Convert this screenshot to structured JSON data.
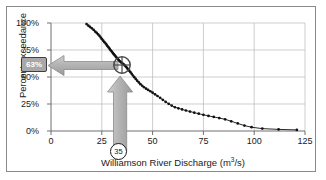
{
  "figure": {
    "name": "flow-duration-curve",
    "frame_color": "#8a8a8a",
    "background": "#ffffff"
  },
  "chart_data": {
    "type": "line",
    "title": "",
    "subtitle": "",
    "xlabel": "Williamson River Discharge (m3/s)",
    "xlabel_main": "Williamson River Discharge (m",
    "xlabel_sup": "3",
    "xlabel_tail": "/s)",
    "ylabel": "Percent exceedance",
    "xlim": [
      0,
      125
    ],
    "ylim": [
      0,
      100
    ],
    "grid": true,
    "legend": "none",
    "xticks": [
      0,
      25,
      50,
      75,
      100,
      125
    ],
    "xticklabels": [
      "0",
      "25",
      "50",
      "75",
      "100",
      "125"
    ],
    "yticks": [
      0,
      25,
      50,
      75,
      100
    ],
    "yticklabels": [
      "0%",
      "25%",
      "50%",
      "75%",
      "100%"
    ],
    "series": [
      {
        "name": "Flow duration curve",
        "marker": "dot",
        "color": "#111111",
        "x": [
          17.5,
          18.4,
          19.2,
          20.1,
          21.0,
          21.8,
          22.5,
          23.2,
          23.9,
          24.5,
          25.1,
          25.7,
          26.3,
          26.9,
          27.4,
          27.9,
          28.4,
          28.9,
          29.4,
          29.9,
          30.4,
          30.9,
          31.4,
          31.9,
          32.4,
          32.9,
          33.4,
          33.9,
          34.4,
          34.9,
          35.4,
          35.9,
          36.4,
          36.9,
          37.4,
          37.9,
          38.5,
          39.1,
          39.7,
          40.3,
          41.0,
          41.7,
          42.4,
          43.2,
          44.0,
          44.9,
          45.8,
          46.8,
          47.8,
          48.9,
          50.0,
          51.2,
          52.4,
          53.7,
          55.0,
          56.4,
          57.9,
          59.4,
          61.0,
          62.7,
          64.5,
          66.4,
          68.4,
          70.5,
          72.7,
          75.0,
          77.5,
          80.1,
          82.8,
          85.7,
          88.7,
          91.9,
          95.2,
          98.7,
          104.0,
          112.0,
          121.0
        ],
        "y": [
          99.0,
          97.5,
          96.4,
          95.1,
          93.6,
          92.0,
          90.8,
          89.4,
          88.0,
          86.5,
          85.0,
          83.6,
          82.2,
          81.0,
          79.7,
          78.4,
          77.2,
          76.0,
          74.7,
          73.5,
          72.3,
          71.1,
          70.0,
          68.8,
          67.7,
          66.6,
          65.6,
          64.6,
          63.7,
          63.0,
          62.2,
          61.4,
          60.5,
          59.5,
          58.4,
          57.2,
          55.9,
          54.5,
          53.0,
          51.4,
          49.8,
          48.2,
          46.6,
          45.0,
          43.4,
          41.9,
          40.5,
          39.2,
          38.0,
          36.8,
          35.5,
          34.0,
          32.4,
          30.7,
          28.9,
          27.0,
          25.2,
          23.5,
          22.0,
          21.0,
          20.0,
          19.0,
          18.0,
          17.0,
          16.0,
          15.0,
          14.0,
          13.0,
          12.0,
          10.8,
          9.0,
          7.0,
          5.0,
          3.5,
          2.2,
          1.5,
          1.0
        ]
      }
    ],
    "annotations": {
      "marker_point": {
        "name": "exceedance-marker",
        "x": 35,
        "y": 63,
        "style": "crosshair-circle",
        "color": "#3a3a3a"
      },
      "percent_callout": {
        "name": "percent-exceedance-callout",
        "text": "63%",
        "box_color": "#a8a8a8",
        "border_color": "#404040",
        "text_color": "#ffffff"
      },
      "discharge_callout": {
        "name": "discharge-callout",
        "text": "35",
        "shape": "circle",
        "text_color": "#1a1a1a"
      },
      "horizontal_arrow": {
        "name": "horizontal-arrow-left",
        "direction": "left",
        "from_x": 35,
        "to_y": 63,
        "color": "#b0b0b0",
        "stroke": "#8c8c8c"
      },
      "vertical_arrow": {
        "name": "vertical-arrow-up",
        "direction": "up",
        "at_x": 35,
        "color": "#b0b0b0",
        "stroke": "#8c8c8c"
      }
    }
  }
}
